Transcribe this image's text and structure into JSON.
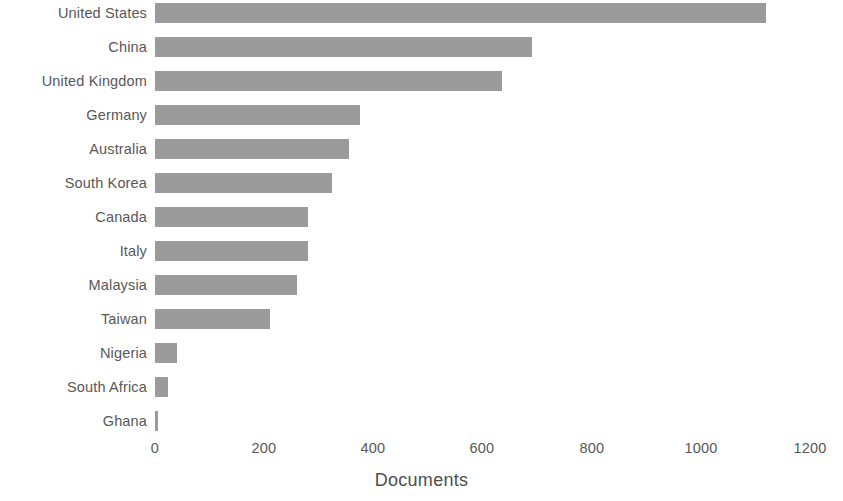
{
  "chart_data": {
    "type": "bar",
    "orientation": "horizontal",
    "title": "",
    "subtitle": "",
    "xlabel": "Documents",
    "ylabel": "",
    "categories": [
      "United States",
      "China",
      "United Kingdom",
      "Germany",
      "Australia",
      "South Korea",
      "Canada",
      "Italy",
      "Malaysia",
      "Taiwan",
      "Nigeria",
      "South Africa",
      "Ghana"
    ],
    "values": [
      1120,
      690,
      635,
      375,
      355,
      325,
      280,
      280,
      260,
      210,
      40,
      24,
      5
    ],
    "xlim": [
      0,
      1200
    ],
    "xticks": [
      0,
      200,
      400,
      600,
      800,
      1000,
      1200
    ],
    "xtick_labels": [
      "0",
      "200",
      "400",
      "600",
      "800",
      "1000",
      "1200"
    ],
    "grid": false,
    "legend": false,
    "legend_position": "none",
    "bar_color": "#9b9b9b",
    "text_color": "#585858",
    "background_color": "#ffffff"
  }
}
